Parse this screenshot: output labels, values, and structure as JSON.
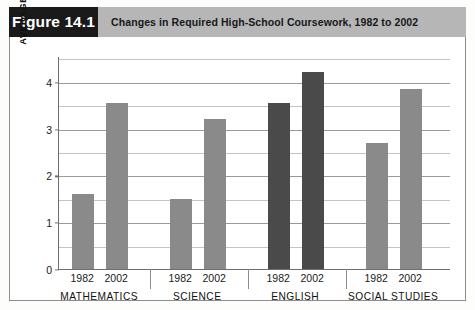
{
  "figure": {
    "tag": "Figure 14.1",
    "title": "Changes in Required High-School Coursework, 1982 to 2002"
  },
  "colors": {
    "tag_background": "#1a1a1a",
    "tag_text": "#ffffff",
    "title_strip": "#b6b6b6",
    "bar_light": "#8a8a8a",
    "bar_dark": "#4a4a4a",
    "grid_major": "#9a9a9a",
    "grid_minor": "#c4c4c4",
    "axis": "#6f6f6f",
    "frame": "#8d8d8d",
    "plot_background": "#ffffff"
  },
  "chart_data": {
    "type": "bar",
    "title": "Changes in Required High-School Coursework, 1982 to 2002",
    "xlabel": "",
    "ylabel": "AVERAGE HOURS OF COURSEWORK REQUIRED",
    "ylim": [
      0,
      4.55
    ],
    "yticks": [
      0,
      1,
      2,
      3,
      4
    ],
    "ytick_labels": [
      "0",
      "1",
      "2",
      "3",
      "4"
    ],
    "minor_yticks": [
      0.5,
      1.5,
      2.5,
      3.5,
      4.5
    ],
    "grid": true,
    "legend": false,
    "categories": [
      "MATHEMATICS",
      "SCIENCE",
      "ENGLISH",
      "SOCIAL STUDIES"
    ],
    "series": [
      {
        "name": "1982",
        "values": [
          1.6,
          1.5,
          3.55,
          2.7
        ]
      },
      {
        "name": "2002",
        "values": [
          3.55,
          3.2,
          4.2,
          3.85
        ]
      }
    ],
    "bar_colors": [
      "#8a8a8a",
      "#8a8a8a",
      "#4a4a4a",
      "#8a8a8a"
    ],
    "year_labels": [
      "1982",
      "2002",
      "1982",
      "2002",
      "1982",
      "2002",
      "1982",
      "2002"
    ]
  }
}
